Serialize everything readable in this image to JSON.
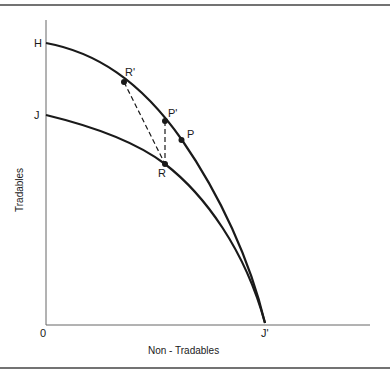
{
  "diagram": {
    "type": "production-possibility-frontier",
    "axes": {
      "x_label": "Non - Tradables",
      "y_label": "Tradables",
      "origin_label": "0"
    },
    "curves": [
      {
        "name": "HJ'",
        "from": "H",
        "to": "J'",
        "style": "solid"
      },
      {
        "name": "JJ'",
        "from": "J",
        "to": "J'",
        "style": "solid"
      }
    ],
    "points": {
      "H": "H",
      "J": "J",
      "J_prime": "J'",
      "R_prime": "R'",
      "P_prime": "P'",
      "P": "P",
      "R": "R"
    },
    "connectors": [
      {
        "from": "R'",
        "to": "R",
        "style": "dashed"
      },
      {
        "from": "P'",
        "to": "R",
        "style": "dashed"
      }
    ],
    "colors": {
      "ink": "#1a1a1a",
      "axis": "#555555",
      "border": "#333333",
      "background": "#ffffff"
    }
  }
}
